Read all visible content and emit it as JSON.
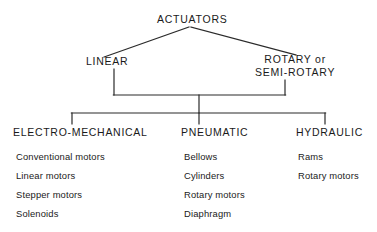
{
  "diagram": {
    "type": "hierarchy-tree",
    "title": "ACTUATORS",
    "line_color": "#2b2b2b",
    "text_color": "#1a1a1a",
    "background_color": "#ffffff",
    "root": {
      "label": "ACTUATORS"
    },
    "tier2": [
      {
        "label": "LINEAR",
        "line1": "LINEAR",
        "line2": ""
      },
      {
        "label": "ROTARY or SEMI-ROTARY",
        "line1": "ROTARY or",
        "line2": "SEMI-ROTARY"
      }
    ],
    "columns": [
      {
        "header": "ELECTRO-MECHANICAL",
        "items": [
          "Conventional motors",
          "Linear motors",
          "Stepper motors",
          "Solenoids"
        ]
      },
      {
        "header": "PNEUMATIC",
        "items": [
          "Bellows",
          "Cylinders",
          "Rotary motors",
          "Diaphragm"
        ]
      },
      {
        "header": "HYDRAULIC",
        "items": [
          "Rams",
          "Rotary motors"
        ]
      }
    ]
  }
}
